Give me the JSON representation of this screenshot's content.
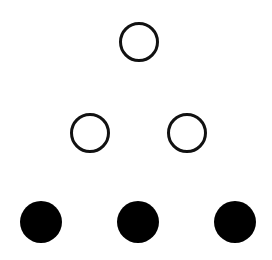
{
  "diagram": {
    "colors": {
      "background": "#ffffff",
      "stroke": "#111111",
      "fill": "#000000"
    },
    "rows": [
      {
        "name": "top",
        "circles": [
          {
            "cx": 139,
            "cy": 42,
            "r": 20,
            "style": "open"
          }
        ]
      },
      {
        "name": "middle",
        "circles": [
          {
            "cx": 90,
            "cy": 133,
            "r": 20,
            "style": "open"
          },
          {
            "cx": 187,
            "cy": 133,
            "r": 20,
            "style": "open"
          }
        ]
      },
      {
        "name": "bottom",
        "circles": [
          {
            "cx": 41,
            "cy": 222,
            "r": 21,
            "style": "filled"
          },
          {
            "cx": 138,
            "cy": 222,
            "r": 21,
            "style": "filled"
          },
          {
            "cx": 235,
            "cy": 222,
            "r": 21,
            "style": "filled"
          }
        ]
      }
    ]
  }
}
